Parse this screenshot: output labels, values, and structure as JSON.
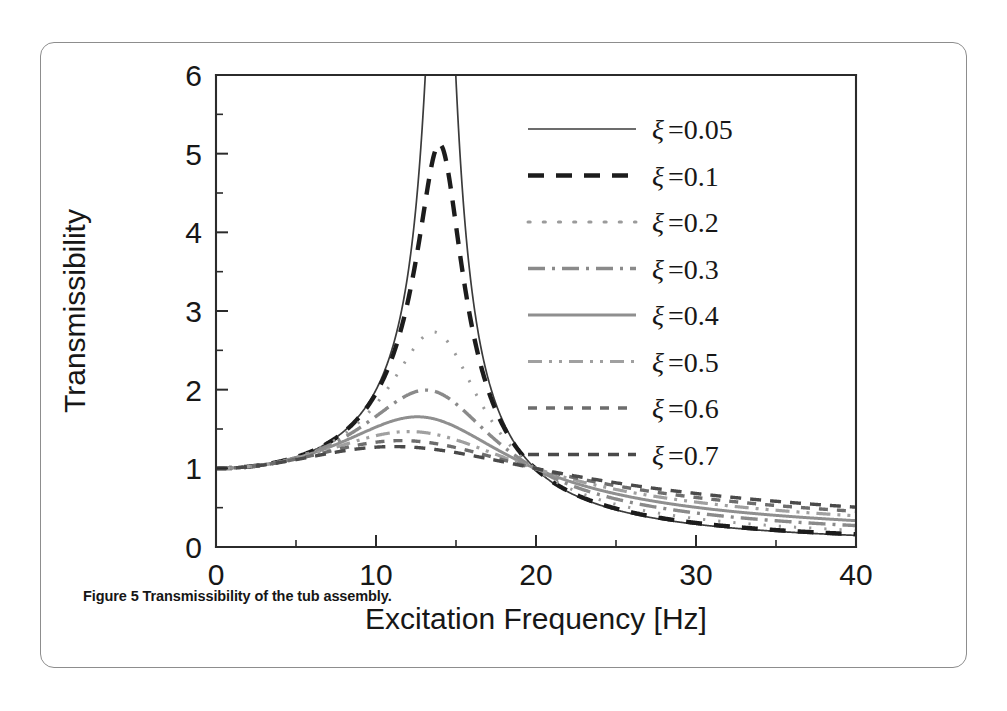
{
  "figure": {
    "caption_label": "Figure 5",
    "caption_text": "Transmissibility of the tub assembly.",
    "panel_border_color": "#8d8d8d",
    "background_color": "#ffffff"
  },
  "chart_data": {
    "type": "line",
    "title": "",
    "xlabel": "Excitation Frequency [Hz]",
    "ylabel": "Transmissibility",
    "xlim": [
      0,
      40
    ],
    "ylim": [
      0,
      6
    ],
    "xticks": [
      0,
      10,
      20,
      30,
      40
    ],
    "xtick_labels": [
      "0",
      "10",
      "20",
      "30",
      "40"
    ],
    "x_minor_tick_step": 5,
    "yticks": [
      0,
      1,
      2,
      3,
      4,
      5,
      6
    ],
    "ytick_labels": [
      "0",
      "1",
      "2",
      "3",
      "4",
      "5",
      "6"
    ],
    "y_minor_tick_step": 0.5,
    "grid": false,
    "legend_position": "upper right",
    "natural_frequency_hz": 14.1,
    "x": [
      0,
      1,
      2,
      3,
      4,
      5,
      6,
      7,
      8,
      9,
      10,
      11,
      12,
      12.5,
      13,
      13.5,
      14,
      14.5,
      15,
      16,
      17,
      18,
      19,
      20,
      22,
      24,
      26,
      28,
      30,
      32,
      34,
      36,
      38,
      40
    ],
    "series": [
      {
        "name": "xi-0.05",
        "label_symbol": "ξ",
        "label_text": "=0.05",
        "damping_ratio": 0.05,
        "style": "solid",
        "color": "#3b3b3b",
        "width": 1.7,
        "peak_value": 10.0,
        "peak_frequency_hz": 14.05,
        "value_at_40hz": 0.26,
        "values": [
          1,
          1.005,
          1.021,
          1.05,
          1.094,
          1.158,
          1.25,
          1.385,
          1.6,
          1.99,
          2.88,
          5.5,
          9.6,
          10.0,
          9.6,
          7.4,
          5.0,
          3.55,
          2.68,
          1.73,
          1.32,
          1.09,
          0.93,
          0.82,
          0.65,
          0.54,
          0.46,
          0.4,
          0.35,
          0.32,
          0.29,
          0.27,
          0.26,
          0.25
        ]
      },
      {
        "name": "xi-0.1",
        "label_symbol": "ξ",
        "label_text": "=0.1",
        "damping_ratio": 0.1,
        "style": "dashed",
        "color": "#1c1c1c",
        "width": 4.4,
        "peak_value": 5.12,
        "peak_frequency_hz": 13.9,
        "value_at_40hz": 0.29,
        "values": [
          1,
          1.005,
          1.021,
          1.05,
          1.093,
          1.156,
          1.247,
          1.378,
          1.583,
          1.938,
          2.66,
          4.05,
          5.0,
          5.12,
          4.95,
          4.35,
          3.62,
          2.95,
          2.44,
          1.76,
          1.37,
          1.13,
          0.97,
          0.85,
          0.68,
          0.57,
          0.49,
          0.43,
          0.38,
          0.345,
          0.32,
          0.3,
          0.29,
          0.285
        ]
      },
      {
        "name": "xi-0.2",
        "label_symbol": "ξ",
        "label_text": "=0.2",
        "damping_ratio": 0.2,
        "style": "dotted",
        "color": "#9b9b9b",
        "width": 3.0,
        "peak_value": 2.62,
        "peak_frequency_hz": 13.5,
        "value_at_40hz": 0.36,
        "values": [
          1,
          1.005,
          1.02,
          1.048,
          1.09,
          1.15,
          1.236,
          1.356,
          1.532,
          1.79,
          2.13,
          2.46,
          2.61,
          2.62,
          2.58,
          2.47,
          2.32,
          2.14,
          1.96,
          1.63,
          1.38,
          1.2,
          1.05,
          0.94,
          0.78,
          0.66,
          0.58,
          0.52,
          0.47,
          0.43,
          0.4,
          0.38,
          0.365,
          0.355
        ]
      },
      {
        "name": "xi-0.3",
        "label_symbol": "ξ",
        "label_text": "=0.3",
        "damping_ratio": 0.3,
        "style": "dashdot",
        "color": "#8a8a8a",
        "width": 3.4,
        "peak_value": 1.93,
        "peak_frequency_hz": 13.0,
        "value_at_40hz": 0.43,
        "values": [
          1,
          1.004,
          1.019,
          1.045,
          1.085,
          1.14,
          1.216,
          1.318,
          1.453,
          1.617,
          1.782,
          1.895,
          1.93,
          1.928,
          1.915,
          1.89,
          1.85,
          1.79,
          1.72,
          1.57,
          1.41,
          1.27,
          1.15,
          1.05,
          0.89,
          0.78,
          0.69,
          0.63,
          0.58,
          0.54,
          0.5,
          0.48,
          0.46,
          0.445
        ]
      },
      {
        "name": "xi-0.4",
        "label_symbol": "ξ",
        "label_text": "=0.4",
        "damping_ratio": 0.4,
        "style": "solid",
        "color": "#8f8f8f",
        "width": 3.0,
        "peak_value": 1.73,
        "peak_frequency_hz": 12.4,
        "value_at_40hz": 0.5,
        "values": [
          1,
          1.004,
          1.017,
          1.04,
          1.076,
          1.124,
          1.187,
          1.268,
          1.37,
          1.48,
          1.585,
          1.67,
          1.715,
          1.727,
          1.73,
          1.725,
          1.71,
          1.685,
          1.655,
          1.57,
          1.47,
          1.37,
          1.27,
          1.18,
          1.02,
          0.9,
          0.81,
          0.74,
          0.68,
          0.64,
          0.6,
          0.57,
          0.545,
          0.525
        ]
      },
      {
        "name": "xi-0.5",
        "label_symbol": "ξ",
        "label_text": "=0.5",
        "damping_ratio": 0.5,
        "style": "dashdotdot",
        "color": "#a0a0a0",
        "width": 3.2,
        "peak_value": 1.48,
        "peak_frequency_hz": 11.6,
        "value_at_40hz": 0.53,
        "values": [
          1,
          1.003,
          1.014,
          1.034,
          1.064,
          1.103,
          1.152,
          1.213,
          1.285,
          1.36,
          1.425,
          1.465,
          1.482,
          1.483,
          1.48,
          1.472,
          1.46,
          1.443,
          1.42,
          1.37,
          1.31,
          1.25,
          1.18,
          1.12,
          1.0,
          0.9,
          0.82,
          0.76,
          0.71,
          0.67,
          0.63,
          0.6,
          0.575,
          0.555
        ]
      },
      {
        "name": "xi-0.6",
        "label_symbol": "ξ",
        "label_text": "=0.6",
        "damping_ratio": 0.6,
        "style": "dotted-thick",
        "color": "#6d6d6d",
        "width": 3.4,
        "peak_value": 1.36,
        "peak_frequency_hz": 10.8,
        "value_at_40hz": 0.56,
        "values": [
          1,
          1.003,
          1.011,
          1.028,
          1.053,
          1.086,
          1.126,
          1.172,
          1.222,
          1.272,
          1.312,
          1.34,
          1.353,
          1.357,
          1.358,
          1.355,
          1.35,
          1.34,
          1.328,
          1.295,
          1.255,
          1.21,
          1.165,
          1.115,
          1.02,
          0.935,
          0.86,
          0.8,
          0.75,
          0.71,
          0.67,
          0.64,
          0.61,
          0.59
        ]
      },
      {
        "name": "xi-0.7",
        "label_symbol": "ξ",
        "label_text": "=0.7",
        "damping_ratio": 0.7,
        "style": "dashed-small",
        "color": "#4a4a4a",
        "width": 3.4,
        "peak_value": 1.29,
        "peak_frequency_hz": 9.8,
        "value_at_40hz": 0.58,
        "values": [
          1,
          1.002,
          1.009,
          1.022,
          1.042,
          1.068,
          1.098,
          1.132,
          1.166,
          1.2,
          1.228,
          1.25,
          1.263,
          1.268,
          1.27,
          1.27,
          1.268,
          1.263,
          1.255,
          1.235,
          1.21,
          1.18,
          1.15,
          1.115,
          1.04,
          0.97,
          0.905,
          0.85,
          0.8,
          0.76,
          0.72,
          0.69,
          0.66,
          0.635
        ]
      }
    ]
  }
}
